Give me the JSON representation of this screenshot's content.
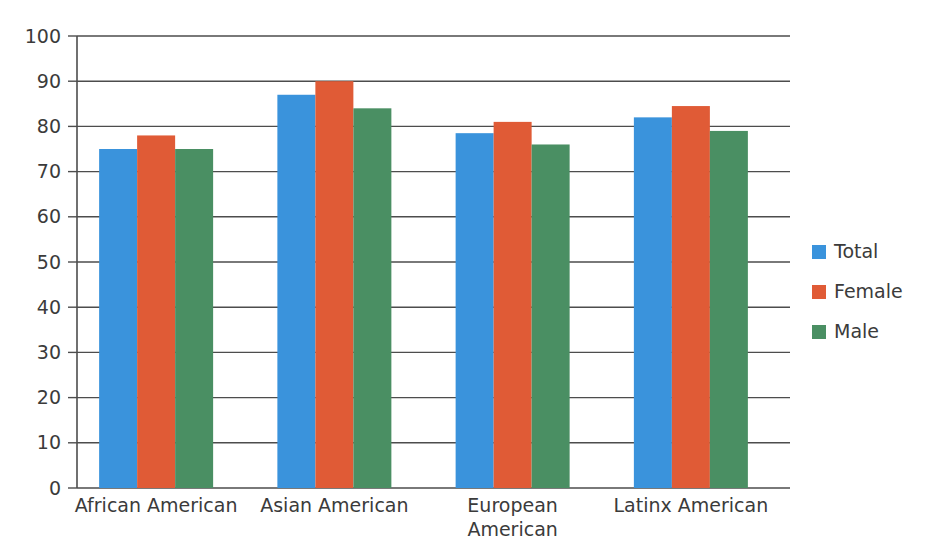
{
  "chart_data": {
    "type": "bar",
    "title": "",
    "subtitle": "",
    "xlabel": "",
    "ylabel": "",
    "ylim": [
      0,
      100
    ],
    "ytick_step": 10,
    "yticks": [
      0,
      10,
      20,
      30,
      40,
      50,
      60,
      70,
      80,
      90,
      100
    ],
    "grid": true,
    "grid_axis": "y",
    "legend_position": "right",
    "categories": [
      "African American",
      "Asian American",
      "European American",
      "Latinx American"
    ],
    "series": [
      {
        "name": "Total",
        "color": "#3a93dc",
        "values": [
          75,
          87,
          78.5,
          82
        ]
      },
      {
        "name": "Female",
        "color": "#e05b36",
        "values": [
          78,
          90,
          81,
          84.5
        ]
      },
      {
        "name": "Male",
        "color": "#4a8f63",
        "values": [
          75,
          84,
          76,
          79
        ]
      }
    ]
  },
  "legend": {
    "items": [
      {
        "label": "Total",
        "color": "#3a93dc"
      },
      {
        "label": "Female",
        "color": "#e05b36"
      },
      {
        "label": "Male",
        "color": "#4a8f63"
      }
    ]
  },
  "axis": {
    "y_tick_labels": [
      "0",
      "10",
      "20",
      "30",
      "40",
      "50",
      "60",
      "70",
      "80",
      "90",
      "100"
    ],
    "x_tick_labels": [
      "African American",
      "Asian American",
      "European American",
      "Latinx American"
    ]
  }
}
